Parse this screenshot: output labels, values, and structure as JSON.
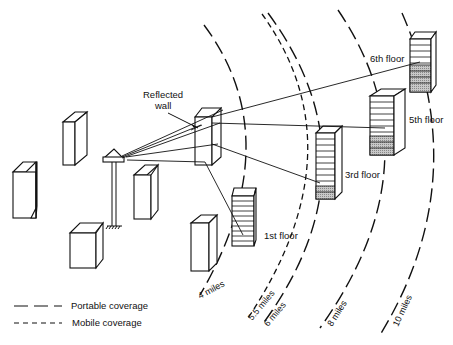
{
  "diagram": {
    "labels": {
      "reflected_wall_line1": "Reflected",
      "reflected_wall_line2": "wall",
      "floor_1": "1st floor",
      "floor_3": "3rd floor",
      "floor_5": "5th floor",
      "floor_6": "6th floor"
    },
    "rings": [
      {
        "label": "4 miles",
        "type": "portable"
      },
      {
        "label": "5.5 miles",
        "type": "mobile"
      },
      {
        "label": "6 miles",
        "type": "portable"
      },
      {
        "label": "8 miles",
        "type": "portable"
      },
      {
        "label": "10 miles",
        "type": "portable"
      }
    ],
    "legend": [
      {
        "label": "Portable coverage",
        "style": "long-dash"
      },
      {
        "label": "Mobile coverage",
        "style": "short-dash"
      }
    ],
    "colors": {
      "line": "#111111",
      "background": "#ffffff",
      "shading": "#bdbdbd"
    }
  }
}
